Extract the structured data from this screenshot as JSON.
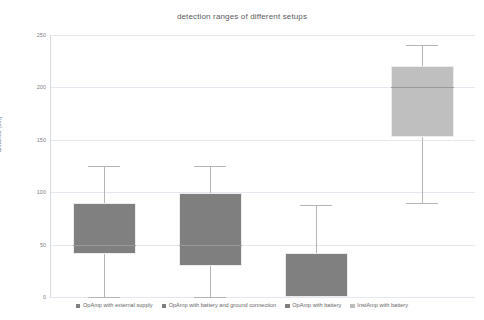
{
  "chart_data": {
    "type": "box",
    "title": "detection ranges of different setups",
    "xlabel": "",
    "ylabel": "distance [cm]",
    "ylim": [
      0,
      250
    ],
    "yticks": [
      0,
      50,
      100,
      150,
      200,
      250
    ],
    "ytick_labels": [
      "0",
      "50",
      "100",
      "150",
      "200",
      "250"
    ],
    "grid": true,
    "legend_position": "bottom",
    "categories": [
      "OpAmp with external supply",
      "OpAmp with battery and ground connection",
      "OpAmp with battery",
      "InstAmp with battery"
    ],
    "boxes": [
      {
        "name": "OpAmp with external supply",
        "color": "#808080",
        "whisker_low": 0,
        "q1": 41,
        "median": 50,
        "q3": 90,
        "whisker_high": 125
      },
      {
        "name": "OpAmp with battery and ground connection",
        "color": "#7f7f7f",
        "whisker_low": 0,
        "q1": 30,
        "median": 50,
        "q3": 99,
        "whisker_high": 125
      },
      {
        "name": "OpAmp with battery",
        "color": "#808080",
        "whisker_low": 0,
        "q1": 0,
        "median": 0,
        "q3": 42,
        "whisker_high": 88
      },
      {
        "name": "InstAmp with battery",
        "color": "#bfbfbf",
        "whisker_low": 90,
        "q1": 153,
        "median": 200,
        "q3": 220,
        "whisker_high": 240
      }
    ]
  },
  "legend": {
    "items": [
      {
        "label": "OpAmp with external supply",
        "color": "#808080"
      },
      {
        "label": "OpAmp with battery and ground connection",
        "color": "#7f7f7f"
      },
      {
        "label": "OpAmp with battery",
        "color": "#808080"
      },
      {
        "label": "InstAmp with battery",
        "color": "#bfbfbf"
      }
    ]
  }
}
